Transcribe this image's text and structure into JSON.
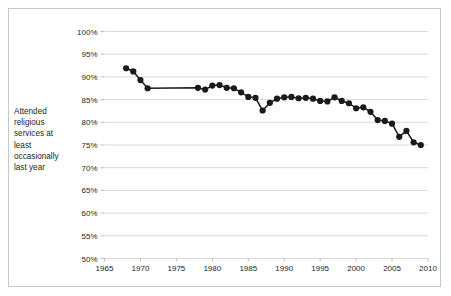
{
  "chart_data": {
    "type": "line",
    "title": "",
    "xlabel": "",
    "ylabel": "Attended religious services at least occasionally last year",
    "xlim": [
      1965,
      2010
    ],
    "ylim": [
      50,
      100
    ],
    "grid": true,
    "legend": "none",
    "ytick_labels": [
      "100%",
      "95%",
      "90%",
      "85%",
      "80%",
      "75%",
      "70%",
      "65%",
      "60%",
      "55%",
      "50%"
    ],
    "ytick_values": [
      100,
      95,
      90,
      85,
      80,
      75,
      70,
      65,
      60,
      55,
      50
    ],
    "xtick_labels": [
      "1965",
      "1970",
      "1975",
      "1980",
      "1985",
      "1990",
      "1995",
      "2000",
      "2005",
      "2010"
    ],
    "xtick_values": [
      1965,
      1970,
      1975,
      1980,
      1985,
      1990,
      1995,
      2000,
      2005,
      2010
    ],
    "series": [
      {
        "name": "Attended religious services at least occasionally last year",
        "x": [
          1968,
          1969,
          1970,
          1971,
          1978,
          1979,
          1980,
          1981,
          1982,
          1983,
          1984,
          1985,
          1986,
          1987,
          1988,
          1989,
          1990,
          1991,
          1992,
          1993,
          1994,
          1995,
          1996,
          1997,
          1998,
          1999,
          2000,
          2001,
          2002,
          2003,
          2004,
          2005,
          2006,
          2007,
          2008,
          2009
        ],
        "values": [
          91.9,
          91.2,
          89.3,
          87.5,
          87.6,
          87.2,
          88.1,
          88.2,
          87.6,
          87.5,
          86.6,
          85.6,
          85.4,
          82.6,
          84.3,
          85.2,
          85.5,
          85.6,
          85.3,
          85.4,
          85.2,
          84.7,
          84.6,
          85.5,
          84.7,
          84.2,
          83.1,
          83.3,
          82.3,
          80.5,
          80.3,
          79.7,
          76.8,
          78.1,
          75.6,
          75.0
        ]
      }
    ]
  },
  "axis_title": {
    "line1": "Attended",
    "line2": "religious",
    "line3": "services at",
    "line4": "least",
    "line5": "occasionally",
    "line6": "last year"
  }
}
